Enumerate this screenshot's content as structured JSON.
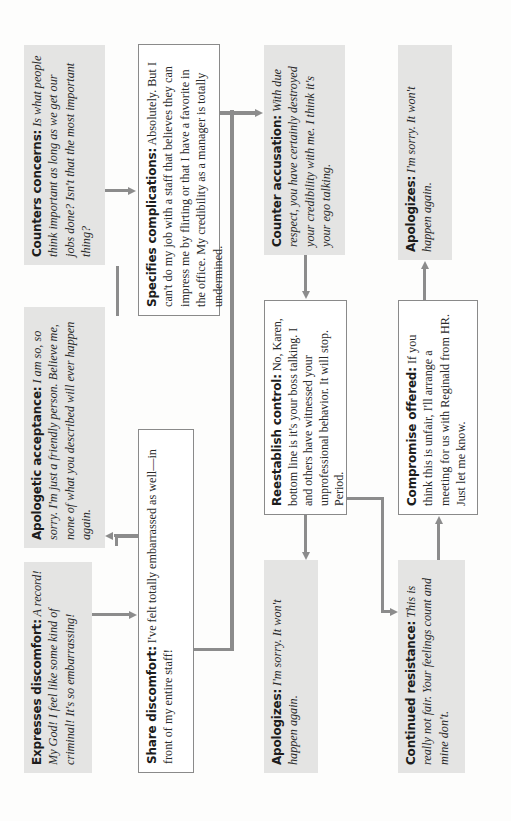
{
  "diagram": {
    "orientation": "rotated 90 degrees counterclockwise",
    "colors": {
      "gray_box": "#e4e4e3",
      "white_box_border": "#8a8a8a",
      "connector": "#8c8c8c"
    },
    "nodes": {
      "expresses_discomfort": {
        "label": "Expresses discomfort:",
        "text": " A record! My God! I feel like some kind of criminal! It's so embarrassing!",
        "style": "gray-italic"
      },
      "share_discomfort": {
        "label": "Share discomfort:",
        "text": " I've felt totally embarrassed as well—in front of my entire staff!",
        "style": "white-roman"
      },
      "apologetic_acceptance": {
        "label": "Apologetic acceptance:",
        "text": " I am so, so sorry. I'm just a friendly person. Believe me, none of what you described will ever happen again.",
        "style": "gray-italic"
      },
      "counters_concerns": {
        "label": "Counters concerns:",
        "text": " Is what people think important as long as we get our jobs done? Isn't that the most important thing?",
        "style": "gray-italic"
      },
      "specifies_complications": {
        "label": "Specifies complications:",
        "text": " Absolutely. But I can't do my job with a staff that believes they can impress me by flirting or that I have a favorite in the office. My credibility as a manager is totally undermined.",
        "style": "white-roman"
      },
      "counter_accusation": {
        "label": "Counter accusation:",
        "text": " With due respect, you have certainly destroyed your credibility with me. I think it's your ego talking.",
        "style": "gray-italic"
      },
      "reestablish_control": {
        "label": "Reestablish control:",
        "text": " No, Karen, bottom line is it's your boss talking. I and others have witnessed your unprofessional behavior. It will stop. Period.",
        "style": "white-roman"
      },
      "apologizes_middle": {
        "label": "Apologizes:",
        "text": " I'm sorry. It won't happen again.",
        "style": "gray-italic"
      },
      "continued_resistance": {
        "label": "Continued resistance:",
        "text": " This is really not fair. Your feelings count and mine don't.",
        "style": "gray-italic"
      },
      "compromise_offered": {
        "label": "Compromise offered:",
        "text": " If you think this is unfair, I'll arrange a meeting for us with Reginald from HR. Just let me know.",
        "style": "white-roman"
      },
      "apologizes_right": {
        "label": "Apologizes:",
        "text": " I'm sorry. It won't happen again.",
        "style": "gray-italic"
      }
    },
    "edges": [
      {
        "from": "expresses_discomfort",
        "to": "share_discomfort"
      },
      {
        "from": "share_discomfort",
        "to": "apologetic_acceptance"
      },
      {
        "from": "share_discomfort",
        "to": "counters_concerns"
      },
      {
        "from": "counters_concerns",
        "to": "specifies_complications"
      },
      {
        "from": "specifies_complications",
        "to": "counter_accusation"
      },
      {
        "from": "specifies_complications",
        "to": "apologizes_middle"
      },
      {
        "from": "counter_accusation",
        "to": "reestablish_control"
      },
      {
        "from": "reestablish_control",
        "to": "apologizes_middle"
      },
      {
        "from": "reestablish_control",
        "to": "continued_resistance"
      },
      {
        "from": "continued_resistance",
        "to": "compromise_offered"
      },
      {
        "from": "compromise_offered",
        "to": "apologizes_right"
      }
    ]
  }
}
